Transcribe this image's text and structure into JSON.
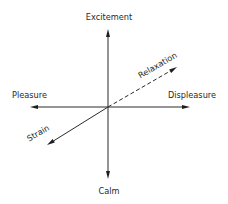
{
  "diagram": {
    "title": "",
    "center": {
      "x": 108,
      "y": 107
    },
    "axes": [
      {
        "id": "vertical-up",
        "label": "Excitement",
        "style": "solid",
        "from": [
          108,
          107
        ],
        "to": [
          108,
          29
        ]
      },
      {
        "id": "vertical-down",
        "label": "Calm",
        "style": "solid",
        "from": [
          108,
          107
        ],
        "to": [
          108,
          179
        ]
      },
      {
        "id": "horizontal-left",
        "label": "Pleasure",
        "style": "solid",
        "from": [
          108,
          107
        ],
        "to": [
          30,
          107
        ]
      },
      {
        "id": "horizontal-right",
        "label": "Displeasure",
        "style": "solid",
        "from": [
          108,
          107
        ],
        "to": [
          190,
          107
        ]
      },
      {
        "id": "diagonal-up-right",
        "label": "Relaxation",
        "style": "dashed",
        "from": [
          108,
          107
        ],
        "to": [
          177,
          67
        ]
      },
      {
        "id": "diagonal-down-left",
        "label": "Strain",
        "style": "solid",
        "from": [
          108,
          107
        ],
        "to": [
          47,
          145
        ]
      }
    ],
    "labels": {
      "top": "Excitement",
      "bottom": "Calm",
      "left": "Pleasure",
      "right": "Displeasure",
      "diagonal_upper": "Relaxation",
      "diagonal_lower": "Strain"
    },
    "colors": {
      "line": "#2a2a2a",
      "text": "#2a2a2a",
      "background": "#ffffff"
    }
  }
}
